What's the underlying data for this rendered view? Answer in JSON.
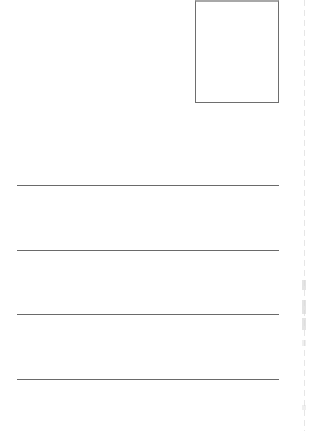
{
  "document": {
    "type": "postcard-back-template",
    "stamp_box": {
      "label": "",
      "border_color": "#6e6e6e"
    },
    "address_lines": [
      {
        "index": 1,
        "y": 185,
        "text": ""
      },
      {
        "index": 2,
        "y": 250,
        "text": ""
      },
      {
        "index": 3,
        "y": 314,
        "text": ""
      },
      {
        "index": 4,
        "y": 379,
        "text": ""
      }
    ],
    "colors": {
      "background": "#ffffff",
      "line": "#6a6a6a",
      "edge_artifact": "#e6e6e6"
    }
  }
}
